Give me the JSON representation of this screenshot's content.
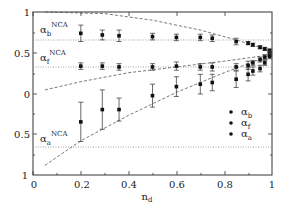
{
  "chart_data": {
    "type": "scatter",
    "title": "",
    "xlabel": "n_d",
    "ylabel": "",
    "xlim": [
      0,
      1
    ],
    "ylim_note": "upper half: value 1 (top) to 0 (middle); lower half: 0 (middle) to 1 (bottom) for alpha_a",
    "x_ticks": [
      "0",
      "0.2",
      "0.4",
      "0.6",
      "0.8",
      "1"
    ],
    "y_ticks": [
      "1",
      "0.5",
      "0",
      "0.5",
      "1"
    ],
    "grid": false,
    "legend_position": "lower right",
    "legend": [
      "α_b",
      "α_f",
      "α_a"
    ],
    "reference_lines": [
      {
        "label": "α_b^NCA",
        "value": 0.66,
        "half": "upper"
      },
      {
        "label": "α_f^NCA",
        "value": 0.33,
        "half": "upper"
      },
      {
        "label": "α_a^NCA",
        "value": 0.65,
        "half": "lower"
      }
    ],
    "series": [
      {
        "name": "α_b",
        "half": "upper",
        "x": [
          0.2,
          0.29,
          0.36,
          0.5,
          0.6,
          0.7,
          0.75,
          0.85,
          0.9,
          0.92,
          0.95,
          0.97,
          0.99
        ],
        "y": [
          0.74,
          0.72,
          0.71,
          0.7,
          0.69,
          0.69,
          0.68,
          0.64,
          0.62,
          0.6,
          0.57,
          0.55,
          0.53
        ],
        "err": [
          0.1,
          0.06,
          0.07,
          0.04,
          0.04,
          0.04,
          0.04,
          0.04,
          0.02,
          0.02,
          0.02,
          0.02,
          0.02
        ]
      },
      {
        "name": "α_f",
        "half": "upper",
        "x": [
          0.2,
          0.29,
          0.36,
          0.5,
          0.6,
          0.7,
          0.75,
          0.85,
          0.9,
          0.92,
          0.95,
          0.97,
          0.99
        ],
        "y": [
          0.34,
          0.34,
          0.33,
          0.33,
          0.34,
          0.33,
          0.33,
          0.33,
          0.35,
          0.38,
          0.42,
          0.45,
          0.49
        ],
        "err": [
          0.04,
          0.04,
          0.04,
          0.04,
          0.05,
          0.04,
          0.05,
          0.04,
          0.05,
          0.03,
          0.03,
          0.03,
          0.03
        ]
      },
      {
        "name": "α_a",
        "half": "mixed",
        "x": [
          0.2,
          0.29,
          0.36,
          0.5,
          0.6,
          0.7,
          0.75,
          0.85,
          0.9,
          0.92,
          0.95,
          0.97,
          0.99
        ],
        "y": [
          -0.34,
          -0.19,
          -0.19,
          -0.02,
          0.09,
          0.12,
          0.14,
          0.18,
          0.24,
          0.28,
          0.31,
          0.38,
          0.46
        ],
        "err": [
          0.24,
          0.24,
          0.14,
          0.14,
          0.12,
          0.12,
          0.1,
          0.1,
          0.08,
          0.05,
          0.04,
          0.03,
          0.03
        ]
      }
    ],
    "dashed_curves": [
      {
        "name": "upper bound",
        "x": [
          0.05,
          0.3,
          0.5,
          0.7,
          0.85,
          1.0
        ],
        "y": [
          1.02,
          0.98,
          0.9,
          0.78,
          0.66,
          0.52
        ]
      },
      {
        "name": "middle curve",
        "x": [
          0.05,
          0.2,
          0.4,
          0.6,
          0.8,
          1.0
        ],
        "y": [
          0.05,
          0.15,
          0.26,
          0.33,
          0.4,
          0.48
        ]
      },
      {
        "name": "lower curve",
        "x": [
          0.05,
          0.2,
          0.4,
          0.6,
          0.8,
          1.0
        ],
        "y": [
          -0.87,
          -0.57,
          -0.26,
          0.02,
          0.26,
          0.48
        ]
      }
    ]
  },
  "labels": {
    "x_axis": "n",
    "x_axis_sub": "d",
    "ref_b": "α",
    "ref_b_sub": "b",
    "ref_b_sup": "NCA",
    "ref_f": "α",
    "ref_f_sub": "f",
    "ref_f_sup": "NCA",
    "ref_a": "α",
    "ref_a_sub": "a",
    "ref_a_sup": "NCA",
    "legend_b": "α",
    "legend_b_sub": "b",
    "legend_f": "α",
    "legend_f_sub": "f",
    "legend_a": "α",
    "legend_a_sub": "a",
    "xt0": "0",
    "xt1": "0.2",
    "xt2": "0.4",
    "xt3": "0.6",
    "xt4": "0.8",
    "xt5": "1",
    "yt0": "1",
    "yt1": "0.5",
    "yt2": "0",
    "yt3": "0.5",
    "yt4": "1"
  }
}
